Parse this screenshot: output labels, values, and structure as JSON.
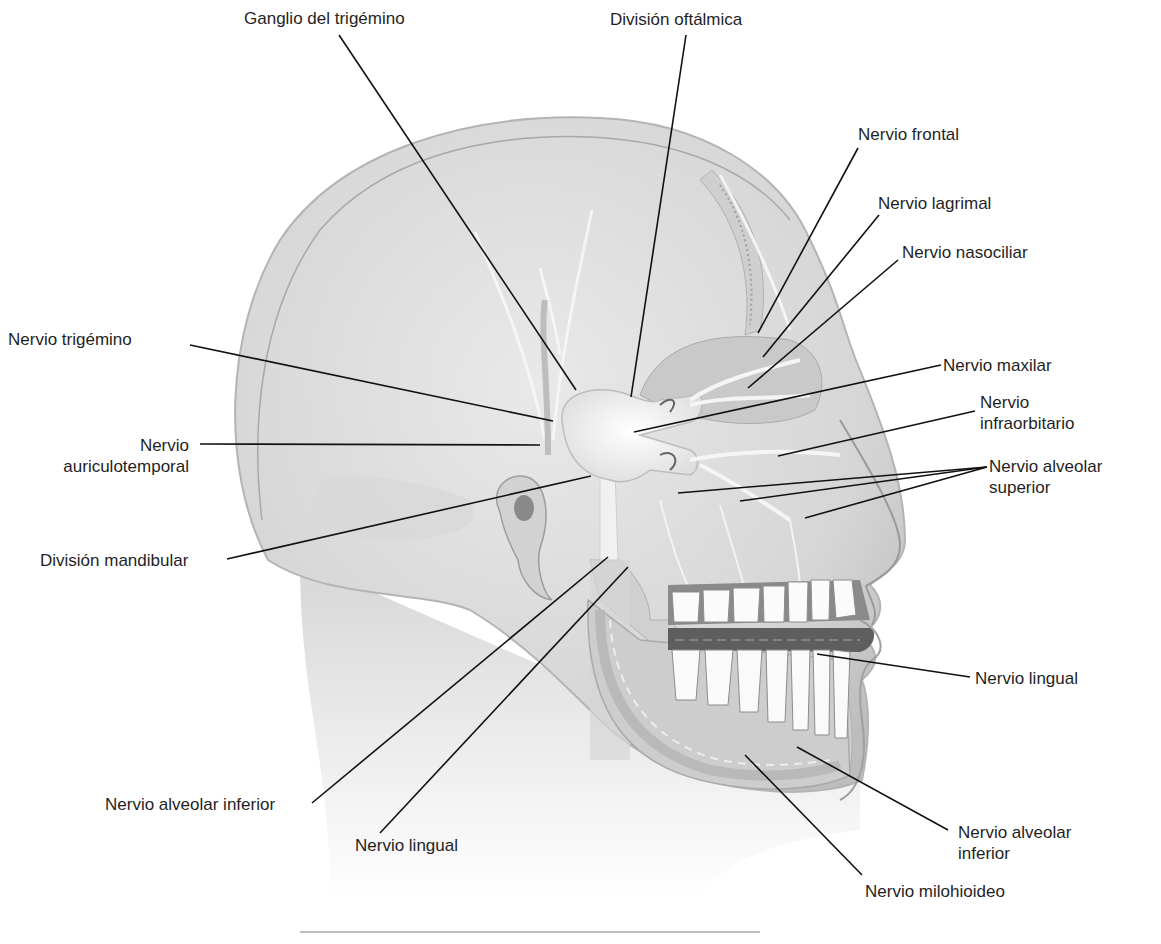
{
  "diagram": {
    "colors": {
      "skin_light": "#e6e6e6",
      "skin_mid": "#cfcfcf",
      "skin_dark": "#a9a9a9",
      "bone": "#d9d9d9",
      "nerve": "#f4f4f4",
      "tooth": "#fbfbfb",
      "gum_dark": "#6f6f6f",
      "leader_line": "#111111",
      "text": "#1f1f1f"
    },
    "labels": [
      {
        "id": "ganglio",
        "text": "Ganglio del trigémino",
        "x": 244,
        "y": 8,
        "align": "left",
        "line": [
          [
            339,
            35
          ],
          [
            576,
            390
          ]
        ]
      },
      {
        "id": "div_oftalmica",
        "text": "División oftálmica",
        "x": 610,
        "y": 9,
        "align": "left",
        "line": [
          [
            686,
            35
          ],
          [
            631,
            397
          ]
        ]
      },
      {
        "id": "frontal",
        "text": "Nervio frontal",
        "x": 858,
        "y": 124,
        "align": "left",
        "line": [
          [
            858,
            148
          ],
          [
            758,
            333
          ]
        ]
      },
      {
        "id": "lagrimal",
        "text": "Nervio lagrimal",
        "x": 878,
        "y": 193,
        "align": "left",
        "line": [
          [
            879,
            215
          ],
          [
            763,
            357
          ]
        ]
      },
      {
        "id": "nasociliar",
        "text": "Nervio nasociliar",
        "x": 902,
        "y": 242,
        "align": "left",
        "line": [
          [
            898,
            260
          ],
          [
            748,
            388
          ]
        ]
      },
      {
        "id": "trigemino",
        "text": "Nervio trigémino",
        "x": 8,
        "y": 329,
        "align": "left",
        "line": [
          [
            190,
            345
          ],
          [
            553,
            421
          ]
        ]
      },
      {
        "id": "maxilar",
        "text": "Nervio maxilar",
        "x": 943,
        "y": 355,
        "align": "left",
        "line": [
          [
            941,
            365
          ],
          [
            634,
            432
          ]
        ]
      },
      {
        "id": "infraorbitario",
        "text": "Nervio",
        "text2": "infraorbitario",
        "x": 980,
        "y": 392,
        "align": "left",
        "line": [
          [
            975,
            411
          ],
          [
            778,
            456
          ]
        ]
      },
      {
        "id": "auriculotemporal",
        "text": "Nervio",
        "text2": "auriculotemporal",
        "x": 30,
        "y": 435,
        "align": "right",
        "width": 159,
        "line": [
          [
            200,
            444
          ],
          [
            540,
            445
          ]
        ]
      },
      {
        "id": "alveolar_sup",
        "text": "Nervio alveolar",
        "text2": "superior",
        "x": 989,
        "y": 456,
        "align": "left",
        "lines": [
          [
            [
              987,
              467
            ],
            [
              678,
              493
            ]
          ],
          [
            [
              987,
              467
            ],
            [
              740,
              501
            ]
          ],
          [
            [
              987,
              467
            ],
            [
              805,
              518
            ]
          ]
        ]
      },
      {
        "id": "div_mandibular",
        "text": "División mandibular",
        "x": 40,
        "y": 550,
        "align": "left",
        "line": [
          [
            227,
            559
          ],
          [
            591,
            476
          ]
        ]
      },
      {
        "id": "lingual_der",
        "text": "Nervio lingual",
        "x": 975,
        "y": 668,
        "align": "left",
        "line": [
          [
            970,
            677
          ],
          [
            817,
            654
          ]
        ]
      },
      {
        "id": "alveolar_inf_izq",
        "text": "Nervio alveolar inferior",
        "x": 105,
        "y": 794,
        "align": "left",
        "line": [
          [
            312,
            803
          ],
          [
            608,
            557
          ]
        ]
      },
      {
        "id": "lingual_izq",
        "text": "Nervio lingual",
        "x": 355,
        "y": 835,
        "align": "left",
        "line": [
          [
            380,
            833
          ],
          [
            628,
            567
          ]
        ]
      },
      {
        "id": "alveolar_inf_der",
        "text": "Nervio alveolar",
        "text2": "inferior",
        "x": 958,
        "y": 822,
        "align": "left",
        "line": [
          [
            948,
            830
          ],
          [
            797,
            747
          ]
        ]
      },
      {
        "id": "milohioideo",
        "text": "Nervio milohioideo",
        "x": 865,
        "y": 881,
        "align": "left",
        "line": [
          [
            862,
            875
          ],
          [
            745,
            755
          ]
        ]
      }
    ],
    "divider": {
      "visible": true
    }
  }
}
